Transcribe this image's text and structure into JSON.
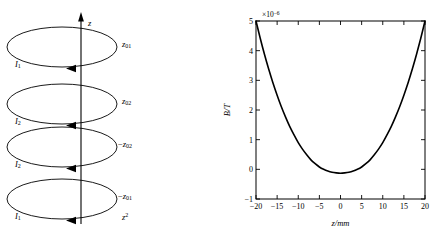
{
  "figure": {
    "left_panel": {
      "name": "coil-stack-diagram",
      "axis_label": "z",
      "bottom_label": "z",
      "bottom_label_sup": "2",
      "coils": [
        {
          "current_label": "I",
          "current_sub": "1",
          "position_label": "z",
          "position_sub": "01",
          "position_sign": ""
        },
        {
          "current_label": "I",
          "current_sub": "2",
          "position_label": "z",
          "position_sub": "02",
          "position_sign": ""
        },
        {
          "current_label": "I",
          "current_sub": "2",
          "position_label": "z",
          "position_sub": "02",
          "position_sign": "−"
        },
        {
          "current_label": "I",
          "current_sub": "1",
          "position_label": "z",
          "position_sub": "01",
          "position_sign": "−"
        }
      ]
    }
  },
  "chart_data": {
    "type": "line",
    "title": "",
    "xlabel": "z/mm",
    "ylabel": "B/T",
    "exponent_label": "×10",
    "exponent_power": "−6",
    "xlim": [
      -20,
      20
    ],
    "ylim": [
      -1,
      5
    ],
    "xticks": [
      -20,
      -15,
      -10,
      -5,
      0,
      5,
      10,
      15,
      20
    ],
    "xticklabels": [
      "−20",
      "−15",
      "−10",
      "−5",
      "0",
      "5",
      "10",
      "15",
      "20"
    ],
    "yticks": [
      -1,
      0,
      1,
      2,
      3,
      4,
      5
    ],
    "yticklabels": [
      "−1",
      "0",
      "1",
      "2",
      "3",
      "4",
      "5"
    ],
    "grid": false,
    "legend": null,
    "series": [
      {
        "name": "B(z)",
        "x": [
          -20,
          -19,
          -18,
          -17,
          -16,
          -15,
          -14,
          -13,
          -12,
          -11,
          -10,
          -9,
          -8,
          -7,
          -6,
          -5,
          -4,
          -3,
          -2,
          -1,
          0,
          1,
          2,
          3,
          4,
          5,
          6,
          7,
          8,
          9,
          10,
          11,
          12,
          13,
          14,
          15,
          16,
          17,
          18,
          19,
          20
        ],
        "y": [
          5.0,
          4.42,
          3.88,
          3.38,
          2.92,
          2.5,
          2.11,
          1.76,
          1.44,
          1.16,
          0.9,
          0.68,
          0.49,
          0.32,
          0.19,
          0.08,
          0.0,
          -0.06,
          -0.1,
          -0.12,
          -0.13,
          -0.12,
          -0.1,
          -0.06,
          0.0,
          0.08,
          0.19,
          0.32,
          0.49,
          0.68,
          0.9,
          1.16,
          1.44,
          1.76,
          2.11,
          2.5,
          2.92,
          3.38,
          3.88,
          4.42,
          5.0
        ]
      }
    ]
  }
}
